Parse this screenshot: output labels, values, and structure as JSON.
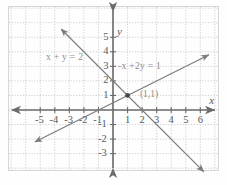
{
  "chart_data": {
    "type": "line",
    "title": "",
    "xlabel": "x",
    "ylabel": "y",
    "xlim": [
      -6.2,
      7.0
    ],
    "ylim": [
      -4.6,
      6.3
    ],
    "grid": true,
    "grid_style": "dotted",
    "legend": "none",
    "x_ticks": [
      -5,
      -4,
      -3,
      -2,
      -1,
      1,
      2,
      3,
      4,
      5,
      6
    ],
    "x_tick_labels": [
      "-5",
      "-4",
      "-3",
      "-2",
      "-1",
      "1",
      "2",
      "3",
      "4",
      "5",
      "6"
    ],
    "y_ticks": [
      5,
      4,
      3,
      2,
      1,
      -1,
      -2,
      -3
    ],
    "y_tick_labels": [
      "5",
      "4",
      "3",
      "2",
      "1",
      "-1",
      "-2",
      "-3"
    ],
    "series": [
      {
        "name": "x + y = 2",
        "equation": "x + y = 2",
        "slope": -1,
        "y_intercept": 2,
        "x_intercept": 2,
        "arrows": "both",
        "endpoints": [
          [
            -3.55,
            5.55
          ],
          [
            6.25,
            -4.25
          ]
        ]
      },
      {
        "name": "-x + 2y = 1",
        "equation": "-x + 2y = 1",
        "slope": 0.5,
        "y_intercept": 0.5,
        "x_intercept": -1,
        "arrows": "both",
        "endpoints": [
          [
            -5.35,
            -2.18
          ],
          [
            6.6,
            3.8
          ]
        ]
      }
    ],
    "annotations": [
      {
        "name": "equation-1-label",
        "text": "x + y = 2",
        "x": -4.6,
        "y": 3.55
      },
      {
        "name": "equation-2-label",
        "text": "-x +2y = 1",
        "x": 0.35,
        "y": 2.95
      },
      {
        "name": "intersection-label",
        "text": "(1,1)",
        "x": 1.85,
        "y": 1.05
      }
    ],
    "points": [
      {
        "name": "intersection-point",
        "label": "(1,1)",
        "x": 1,
        "y": 1,
        "marker": "dot"
      }
    ]
  },
  "colors": {
    "background": "#fefefe",
    "grid": "#c9c9c9",
    "axis": "#6b6b6b",
    "line": "#7d7d7d",
    "text": "#5a5a5a",
    "annotation": "#8c8c8c",
    "border": "#d6d6d6"
  },
  "axes": {
    "x_name": "x",
    "y_name": "y"
  }
}
